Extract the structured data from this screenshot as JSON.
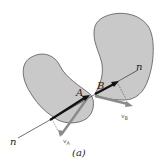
{
  "figure": {
    "caption": "(a)",
    "body_fill": "#c9c9c9",
    "body_stroke": "#555555",
    "normal_line_color": "#333333",
    "velocity_color": "#8a8a8a",
    "normal_vector_color": "#111111"
  },
  "labels": {
    "point_a": "A",
    "point_b": "B",
    "normal_lower": "n",
    "normal_upper": "n",
    "velocity_a_main": "v",
    "velocity_a_sub": "A",
    "velocity_b_main": "v",
    "velocity_b_sub": "B"
  }
}
